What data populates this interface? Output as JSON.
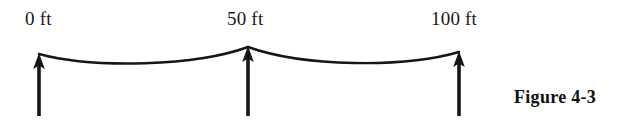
{
  "figure": {
    "caption": "Figure 4-3",
    "background_color": "#ffffff",
    "ink_color": "#161616",
    "width": 629,
    "height": 124
  },
  "stations": [
    {
      "label": "0 ft",
      "value": 0,
      "unit": "ft",
      "x": 39,
      "support_top_y": 54,
      "support_bottom_y": 116
    },
    {
      "label": "50 ft",
      "value": 50,
      "unit": "ft",
      "x": 248,
      "support_top_y": 47,
      "support_bottom_y": 116
    },
    {
      "label": "100 ft",
      "value": 100,
      "unit": "ft",
      "x": 459,
      "support_top_y": 52,
      "support_bottom_y": 116
    }
  ],
  "cable": {
    "description": "sagging cable spanning three supports",
    "left_span_low_point_y": 61,
    "right_span_low_point_y": 60
  },
  "supports": {
    "description": "upward reaction arrows at each station",
    "arrow_direction": "up",
    "count": 3
  }
}
